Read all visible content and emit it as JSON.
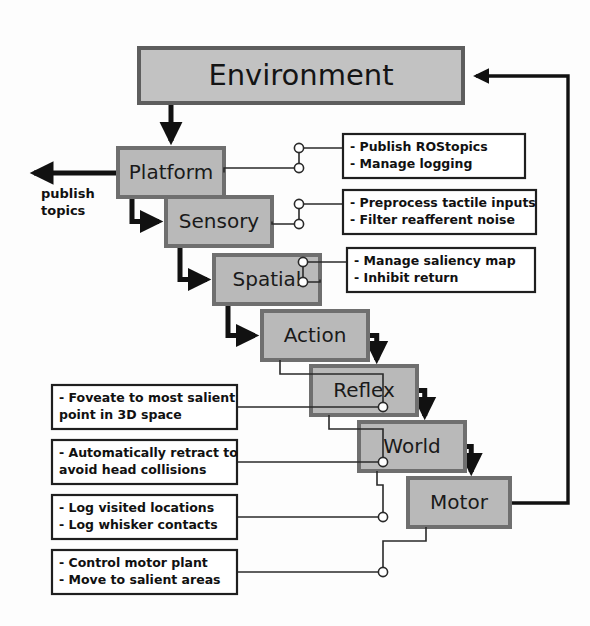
{
  "diagram": {
    "background_color": "#fdfdfd",
    "box_fill": "#b9b9b9",
    "box_border": "#6f6f6f",
    "note_fill": "#ffffff",
    "note_border": "#1f1f1f",
    "arrow_color": "#111111",
    "environment": {
      "label": "Environment",
      "x": 139,
      "y": 48,
      "width": 324,
      "height": 55
    },
    "layers": [
      {
        "id": "platform",
        "label": "Platform",
        "x": 118,
        "y": 148,
        "width": 106,
        "height": 49,
        "font_size": 20
      },
      {
        "id": "sensory",
        "label": "Sensory",
        "x": 166,
        "y": 197,
        "width": 106,
        "height": 49,
        "font_size": 20
      },
      {
        "id": "spatial",
        "label": "Spatial",
        "x": 214,
        "y": 255,
        "width": 106,
        "height": 49,
        "font_size": 20
      },
      {
        "id": "action",
        "label": "Action",
        "x": 262,
        "y": 311,
        "width": 106,
        "height": 49,
        "font_size": 20
      },
      {
        "id": "reflex",
        "label": "Reflex",
        "x": 311,
        "y": 366,
        "width": 106,
        "height": 49,
        "font_size": 20
      },
      {
        "id": "world",
        "label": "World",
        "x": 359,
        "y": 422,
        "width": 106,
        "height": 49,
        "font_size": 20
      },
      {
        "id": "motor",
        "label": "Motor",
        "x": 408,
        "y": 478,
        "width": 102,
        "height": 49,
        "font_size": 20
      }
    ],
    "notes": [
      {
        "id": "platform-note",
        "lines": [
          "- Publish ROStopics",
          "- Manage logging"
        ],
        "x": 343,
        "y": 134,
        "width": 182,
        "height": 44,
        "side": "right",
        "connects_to": "platform"
      },
      {
        "id": "sensory-note",
        "lines": [
          "- Preprocess tactile inputs",
          "- Filter reafferent noise"
        ],
        "x": 343,
        "y": 190,
        "width": 193,
        "height": 44,
        "side": "right",
        "connects_to": "sensory"
      },
      {
        "id": "spatial-note",
        "lines": [
          "- Manage saliency map",
          "- Inhibit return"
        ],
        "x": 347,
        "y": 248,
        "width": 188,
        "height": 44,
        "side": "right",
        "connects_to": "spatial"
      },
      {
        "id": "action-note",
        "lines": [
          "- Foveate to most salient",
          "  point in 3D space"
        ],
        "x": 52,
        "y": 385,
        "width": 185,
        "height": 44,
        "side": "left",
        "connects_to": "action"
      },
      {
        "id": "reflex-note",
        "lines": [
          "- Automatically retract to",
          "avoid head collisions"
        ],
        "x": 52,
        "y": 440,
        "width": 185,
        "height": 44,
        "side": "left",
        "connects_to": "reflex"
      },
      {
        "id": "world-note",
        "lines": [
          "- Log visited locations",
          "- Log whisker contacts"
        ],
        "x": 52,
        "y": 495,
        "width": 185,
        "height": 44,
        "side": "left",
        "connects_to": "world"
      },
      {
        "id": "motor-note",
        "lines": [
          "- Control motor plant",
          "- Move to salient areas"
        ],
        "x": 52,
        "y": 550,
        "width": 185,
        "height": 44,
        "side": "left",
        "connects_to": "motor"
      }
    ],
    "publish_output": {
      "label_lines": [
        "publish",
        "topics"
      ],
      "label_x": 41,
      "label_y": 198
    },
    "feedback_loop": {
      "from": "motor",
      "to": "environment",
      "description": "Motor output returns to Environment"
    }
  }
}
